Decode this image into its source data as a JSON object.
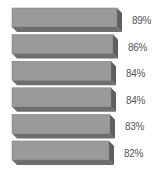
{
  "chart_data": {
    "type": "bar",
    "orientation": "horizontal",
    "style": "3d",
    "categories": [
      "",
      "",
      "",
      "",
      "",
      ""
    ],
    "values": [
      89,
      86,
      84,
      84,
      83,
      82
    ],
    "labels": [
      "89%",
      "86%",
      "84%",
      "84%",
      "83%",
      "82%"
    ],
    "title": "",
    "xlabel": "",
    "ylabel": "",
    "grid": false,
    "legend": null,
    "colors": {
      "front": "#9a9a9a",
      "top": "#b5b5b5",
      "side": "#5e5e5e",
      "bottom": "#6e6e6e"
    }
  }
}
